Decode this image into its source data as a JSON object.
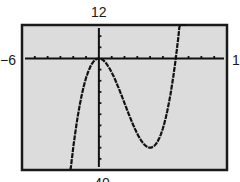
{
  "chart_data": {
    "type": "line",
    "title": "",
    "function": "y = x^3 - 6x^2",
    "xlabel": "",
    "ylabel": "",
    "xlim": [
      -6,
      10
    ],
    "ylim": [
      -40,
      12
    ],
    "xscale": 1,
    "yscale": 4,
    "grid": false,
    "window_labels": {
      "xmin": "−6",
      "xmax": "10",
      "ymin": "−40",
      "ymax": "12"
    },
    "series": [
      {
        "name": "f(x)",
        "x": [
          -2.2,
          -2,
          -1.5,
          -1,
          -0.5,
          0,
          0.5,
          1,
          1.5,
          2,
          2.5,
          3,
          3.5,
          4,
          4.5,
          5,
          5.5,
          6,
          6.5,
          6.9
        ],
        "values": [
          -39.7,
          -32,
          -16.9,
          -7,
          -1.6,
          0,
          -1.4,
          -5,
          -10.1,
          -16,
          -21.9,
          -27,
          -30.6,
          -32,
          -30.4,
          -25,
          -15.1,
          0,
          21.1,
          43.1
        ]
      }
    ],
    "key_points": {
      "local_max": [
        0,
        0
      ],
      "local_min": [
        4,
        -32
      ],
      "x_intercepts": [
        0,
        6
      ]
    }
  },
  "colors": {
    "plot_bg": "#dcdcdc",
    "frame": "#1a1a1a",
    "curve": "#111111",
    "axes": "#111111"
  }
}
